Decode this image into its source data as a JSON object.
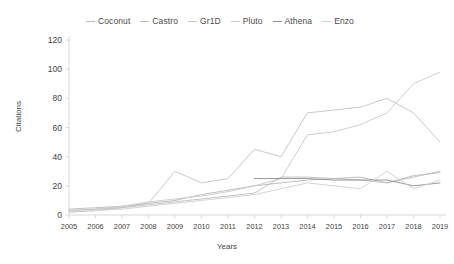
{
  "chart_data": {
    "type": "line",
    "title": "",
    "xlabel": "Years",
    "ylabel": "Citations",
    "categories": [
      2005,
      2006,
      2007,
      2008,
      2009,
      2010,
      2011,
      2012,
      2013,
      2014,
      2015,
      2016,
      2017,
      2018,
      2019
    ],
    "x": [
      "2005",
      "2006",
      "2007",
      "2008",
      "2009",
      "2010",
      "2011",
      "2012",
      "2013",
      "2014",
      "2015",
      "2016",
      "2017",
      "2018",
      "2019"
    ],
    "ylim": [
      0,
      120
    ],
    "yticks": [
      0,
      20,
      40,
      60,
      80,
      100,
      120
    ],
    "grid": false,
    "legend_position": "top",
    "series": [
      {
        "name": "Coconut",
        "color": "#b9b9b9",
        "values": [
          4,
          5,
          6,
          8,
          10,
          14,
          17,
          20,
          22,
          24,
          25,
          26,
          22,
          26,
          30
        ]
      },
      {
        "name": "Castro",
        "color": "#bdbdbd",
        "values": [
          3,
          4,
          5,
          7,
          9,
          11,
          13,
          15,
          26,
          26,
          25,
          24,
          22,
          27,
          29
        ]
      },
      {
        "name": "Gr1D",
        "color": "#c4c4c4",
        "values": [
          2,
          3,
          5,
          8,
          30,
          22,
          25,
          45,
          40,
          70,
          72,
          74,
          80,
          70,
          50
        ]
      },
      {
        "name": "Pluto",
        "color": "#cacaca",
        "values": [
          3,
          4,
          6,
          9,
          11,
          13,
          16,
          20,
          25,
          55,
          57,
          62,
          70,
          90,
          98
        ]
      },
      {
        "name": "Athena",
        "color": "#8f8f8f",
        "values": [
          null,
          null,
          null,
          null,
          null,
          null,
          null,
          25,
          25,
          25,
          24,
          24,
          24,
          20,
          22
        ]
      },
      {
        "name": "Enzo",
        "color": "#d0d0d0",
        "values": [
          2,
          3,
          4,
          6,
          8,
          10,
          12,
          14,
          18,
          22,
          20,
          18,
          30,
          18,
          24
        ]
      }
    ]
  },
  "legend": {
    "items": [
      {
        "label": "Coconut"
      },
      {
        "label": "Castro"
      },
      {
        "label": "Gr1D"
      },
      {
        "label": "Pluto"
      },
      {
        "label": "Athena"
      },
      {
        "label": "Enzo"
      }
    ]
  },
  "axes": {
    "y_title": "Citations",
    "x_title": "Years",
    "y_ticks": [
      "120",
      "100",
      "80",
      "60",
      "40",
      "20",
      "0"
    ],
    "x_ticks": [
      "2005",
      "2006",
      "2007",
      "2008",
      "2009",
      "2010",
      "2011",
      "2012",
      "2013",
      "2014",
      "2015",
      "2016",
      "2017",
      "2018",
      "2019"
    ]
  }
}
